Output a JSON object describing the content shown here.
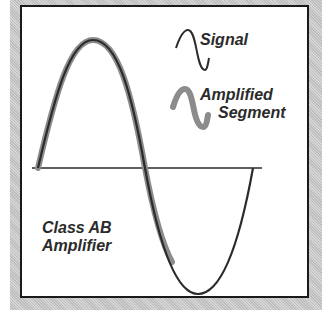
{
  "diagram": {
    "title_lines": [
      "Class AB",
      "Amplifier"
    ],
    "legend": {
      "signal_label": "Signal",
      "amplified_line1": "Amplified",
      "amplified_line2": "Segment",
      "items": [
        {
          "icon": "thin-sine-wave-icon",
          "label": "Signal",
          "color": "#2b2b2b"
        },
        {
          "icon": "thick-gray-sine-wave-icon",
          "label": "Amplified Segment",
          "color": "#8c8c8c"
        }
      ]
    },
    "signal": {
      "type": "sine",
      "cycles": 1,
      "color": "#2b2b2b",
      "amplified_portion": "from start of cycle through positive half and slightly past zero crossing into negative half",
      "amplified_color": "#8c8c8c"
    },
    "baseline": {
      "color": "#2b2b2b"
    }
  }
}
